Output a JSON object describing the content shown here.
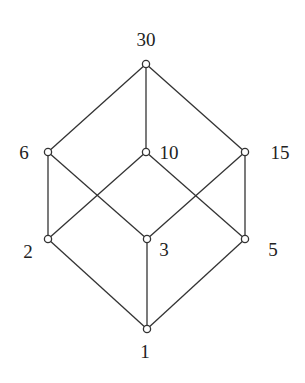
{
  "diagram": {
    "type": "hasse-diagram",
    "nodes": [
      {
        "id": "30",
        "label": "30",
        "x": 146,
        "y": 64,
        "lx": 146,
        "ly": 46,
        "anchor": "middle"
      },
      {
        "id": "6",
        "label": "6",
        "x": 48,
        "y": 152,
        "lx": 24,
        "ly": 159,
        "anchor": "middle"
      },
      {
        "id": "10",
        "label": "10",
        "x": 146,
        "y": 152,
        "lx": 169,
        "ly": 159,
        "anchor": "middle"
      },
      {
        "id": "15",
        "label": "15",
        "x": 245,
        "y": 152,
        "lx": 280,
        "ly": 159,
        "anchor": "middle"
      },
      {
        "id": "2",
        "label": "2",
        "x": 48,
        "y": 239,
        "lx": 28,
        "ly": 258,
        "anchor": "middle"
      },
      {
        "id": "3",
        "label": "3",
        "x": 147,
        "y": 239,
        "lx": 164,
        "ly": 256,
        "anchor": "middle"
      },
      {
        "id": "5",
        "label": "5",
        "x": 245,
        "y": 239,
        "lx": 273,
        "ly": 256,
        "anchor": "middle"
      },
      {
        "id": "1",
        "label": "1",
        "x": 147,
        "y": 329,
        "lx": 145,
        "ly": 358,
        "anchor": "middle"
      }
    ],
    "edges": [
      [
        "30",
        "6"
      ],
      [
        "30",
        "10"
      ],
      [
        "30",
        "15"
      ],
      [
        "6",
        "2"
      ],
      [
        "6",
        "3"
      ],
      [
        "10",
        "2"
      ],
      [
        "10",
        "5"
      ],
      [
        "15",
        "3"
      ],
      [
        "15",
        "5"
      ],
      [
        "2",
        "1"
      ],
      [
        "3",
        "1"
      ],
      [
        "5",
        "1"
      ]
    ]
  }
}
